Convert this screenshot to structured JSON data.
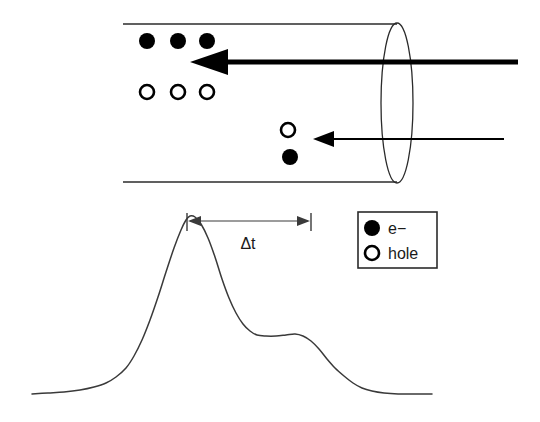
{
  "figure": {
    "background_color": "#ffffff",
    "ink_color": "#000000",
    "curve_color": "#3a3a3a"
  },
  "sample": {
    "shape": "cylinder",
    "top_edge": {
      "x1": 123,
      "y1": 24,
      "x2": 397,
      "y2": 24
    },
    "bottom_edge": {
      "x1": 123,
      "y1": 182,
      "x2": 397,
      "y2": 182
    },
    "face_ellipse": {
      "cx": 397,
      "cy": 103,
      "rx": 16,
      "ry": 80
    }
  },
  "beams": [
    {
      "name": "primary-beam",
      "style": "thick",
      "direction": "right-to-left",
      "tip_x": 190,
      "tail_x": 518,
      "y": 62,
      "shaft_width": 5.2,
      "head_length": 38,
      "head_half_height": 13
    },
    {
      "name": "secondary-beam",
      "style": "thin",
      "direction": "right-to-left",
      "tip_x": 313,
      "tail_x": 504,
      "y": 139,
      "shaft_width": 2.1,
      "head_length": 21,
      "head_half_height": 8
    }
  ],
  "carriers": {
    "electron_radius": 8,
    "hole_radius": 8,
    "electrons": [
      {
        "cx": 147,
        "cy": 41
      },
      {
        "cx": 178,
        "cy": 41
      },
      {
        "cx": 207,
        "cy": 41
      },
      {
        "cx": 290,
        "cy": 157
      }
    ],
    "holes": [
      {
        "cx": 147,
        "cy": 92
      },
      {
        "cx": 178,
        "cy": 92
      },
      {
        "cx": 207,
        "cy": 92
      },
      {
        "cx": 288,
        "cy": 130
      }
    ]
  },
  "legend": {
    "box": {
      "x": 358,
      "y": 212,
      "width": 79,
      "height": 56
    },
    "entries": [
      {
        "marker": "filled-circle",
        "label": "e−",
        "marker_cx": 372,
        "marker_cy": 228,
        "label_x": 388,
        "label_y": 234
      },
      {
        "marker": "open-circle",
        "label": "hole",
        "marker_cx": 372,
        "marker_cy": 253,
        "label_x": 388,
        "label_y": 259
      }
    ]
  },
  "annotation": {
    "name": "delta-t-dimension",
    "label": "Δt",
    "label_x": 248,
    "label_y": 249,
    "line_y": 221,
    "left_x": 187,
    "right_x": 311,
    "tick_top": 213,
    "tick_bottom": 231
  },
  "chart_data": {
    "type": "line",
    "title": "",
    "xlabel": "",
    "ylabel": "",
    "grid": false,
    "legend_position": "right",
    "axis_hidden": true,
    "xlim": [
      32,
      432
    ],
    "ylim_pixels": [
      394,
      216
    ],
    "features": [
      {
        "name": "baseline-left",
        "x": 32,
        "y": 394
      },
      {
        "name": "primary-peak",
        "x": 190,
        "y": 216
      },
      {
        "name": "secondary-shoulder",
        "x": 280,
        "y": 336
      },
      {
        "name": "baseline-right",
        "x": 432,
        "y": 394
      }
    ],
    "points": [
      [
        32,
        394
      ],
      [
        48,
        393
      ],
      [
        64,
        392
      ],
      [
        80,
        390
      ],
      [
        94,
        387
      ],
      [
        106,
        383
      ],
      [
        116,
        377
      ],
      [
        126,
        368
      ],
      [
        134,
        356
      ],
      [
        142,
        340
      ],
      [
        150,
        320
      ],
      [
        158,
        297
      ],
      [
        166,
        272
      ],
      [
        174,
        248
      ],
      [
        181,
        230
      ],
      [
        186,
        220
      ],
      [
        190,
        216
      ],
      [
        195,
        217
      ],
      [
        201,
        224
      ],
      [
        208,
        238
      ],
      [
        215,
        257
      ],
      [
        222,
        279
      ],
      [
        229,
        298
      ],
      [
        236,
        313
      ],
      [
        243,
        324
      ],
      [
        250,
        331
      ],
      [
        257,
        335
      ],
      [
        266,
        336
      ],
      [
        276,
        336
      ],
      [
        286,
        335
      ],
      [
        295,
        334
      ],
      [
        303,
        336
      ],
      [
        311,
        341
      ],
      [
        319,
        349
      ],
      [
        327,
        359
      ],
      [
        335,
        368
      ],
      [
        344,
        376
      ],
      [
        353,
        383
      ],
      [
        362,
        388
      ],
      [
        372,
        391
      ],
      [
        384,
        393
      ],
      [
        398,
        394
      ],
      [
        412,
        394
      ],
      [
        424,
        394
      ],
      [
        432,
        394
      ]
    ]
  }
}
